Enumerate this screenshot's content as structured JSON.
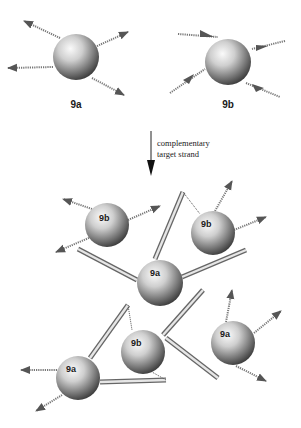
{
  "diagram": {
    "top_row": {
      "particles": [
        {
          "id": "9a",
          "label": "9a",
          "cx": 76,
          "cy": 57,
          "r": 23
        },
        {
          "id": "9b",
          "label": "9b",
          "cx": 228,
          "cy": 62,
          "r": 23
        }
      ]
    },
    "arrow": {
      "caption_line1": "complementary",
      "caption_line2": "target strand"
    },
    "assembly": {
      "particles": [
        {
          "id": "9b-top-left",
          "label": "9b",
          "cx": 107,
          "cy": 225,
          "r": 22
        },
        {
          "id": "9b-top-right",
          "label": "9b",
          "cx": 213,
          "cy": 233,
          "r": 22
        },
        {
          "id": "9a-center",
          "label": "9a",
          "cx": 160,
          "cy": 283,
          "r": 23
        },
        {
          "id": "9b-bottom-center",
          "label": "9b",
          "cx": 143,
          "cy": 352,
          "r": 22
        },
        {
          "id": "9a-bottom-left",
          "label": "9a",
          "cx": 78,
          "cy": 378,
          "r": 22
        },
        {
          "id": "9a-bottom-right",
          "label": "9a",
          "cx": 233,
          "cy": 343,
          "r": 22
        }
      ]
    },
    "colors": {
      "sphere_light": "#f4f4f4",
      "sphere_dark": "#3c3c3c",
      "strand": "#777777",
      "text": "#1a1a1a"
    }
  }
}
